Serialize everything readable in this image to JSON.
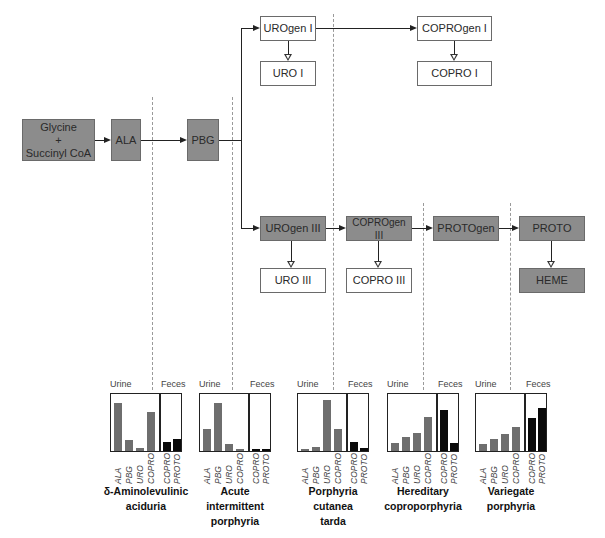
{
  "pathway": {
    "nodes": {
      "glycine": {
        "line1": "Glycine",
        "line2": "+",
        "line3": "Succinyl CoA"
      },
      "ala": "ALA",
      "pbg": "PBG",
      "urogen1": "UROgen I",
      "uro1": "URO I",
      "coprogen1": "COPROgen I",
      "copro1": "COPRO I",
      "urogen3": "UROgen III",
      "uro3": "URO III",
      "coprogen3": "COPROgen III",
      "copro3": "COPRO III",
      "protogen": "PROTOgen",
      "proto": "PROTO",
      "heme": "HEME"
    },
    "colors": {
      "dark_box": "#8c8c8c",
      "light_box": "#ffffff",
      "urine_bar": "#6e6e6e",
      "feces_bar": "#0a0a0a"
    }
  },
  "chart_data": [
    {
      "type": "bar",
      "title": "δ-Aminolevulinic aciduria",
      "groups": [
        "Urine",
        "Feces"
      ],
      "categories": [
        "ALA",
        "PBG",
        "URO",
        "COPRO",
        "COPRO",
        "PROTO"
      ],
      "series": [
        {
          "name": "Urine",
          "values": [
            88,
            20,
            5,
            70,
            null,
            null
          ]
        },
        {
          "name": "Feces",
          "values": [
            null,
            null,
            null,
            null,
            16,
            22
          ]
        }
      ],
      "ylim": [
        0,
        100
      ]
    },
    {
      "type": "bar",
      "title": "Acute intermittent porphyria",
      "groups": [
        "Urine",
        "Feces"
      ],
      "categories": [
        "ALA",
        "PBG",
        "URO",
        "COPRO",
        "COPRO",
        "PROTO"
      ],
      "series": [
        {
          "name": "Urine",
          "values": [
            40,
            88,
            12,
            4,
            null,
            null
          ]
        },
        {
          "name": "Feces",
          "values": [
            null,
            null,
            null,
            null,
            4,
            4
          ]
        }
      ],
      "ylim": [
        0,
        100
      ]
    },
    {
      "type": "bar",
      "title": "Porphyria cutanea tarda",
      "groups": [
        "Urine",
        "Feces"
      ],
      "categories": [
        "ALA",
        "PBG",
        "URO",
        "COPRO",
        "COPRO",
        "PROTO"
      ],
      "series": [
        {
          "name": "Urine",
          "values": [
            4,
            8,
            92,
            40,
            null,
            null
          ]
        },
        {
          "name": "Feces",
          "values": [
            null,
            null,
            null,
            null,
            16,
            5
          ]
        }
      ],
      "ylim": [
        0,
        100
      ]
    },
    {
      "type": "bar",
      "title": "Hereditary coproporphyria",
      "groups": [
        "Urine",
        "Feces"
      ],
      "categories": [
        "ALA",
        "PBG",
        "URO",
        "COPRO",
        "COPRO",
        "PROTO"
      ],
      "series": [
        {
          "name": "Urine",
          "values": [
            15,
            26,
            33,
            61,
            null,
            null
          ]
        },
        {
          "name": "Feces",
          "values": [
            null,
            null,
            null,
            null,
            74,
            15
          ]
        }
      ],
      "ylim": [
        0,
        100
      ]
    },
    {
      "type": "bar",
      "title": "Variegate porphyria",
      "groups": [
        "Urine",
        "Feces"
      ],
      "categories": [
        "ALA",
        "PBG",
        "URO",
        "COPRO",
        "COPRO",
        "PROTO"
      ],
      "series": [
        {
          "name": "Urine",
          "values": [
            12,
            21,
            31,
            43,
            null,
            null
          ]
        },
        {
          "name": "Feces",
          "values": [
            null,
            null,
            null,
            null,
            60,
            79
          ]
        }
      ],
      "ylim": [
        0,
        100
      ]
    }
  ],
  "charts": [
    {
      "urine": "Urine",
      "feces": "Feces",
      "x": [
        "ALA",
        "PBG",
        "URO",
        "COPRO",
        "COPRO",
        "PROTO"
      ],
      "caption": [
        "δ-Aminolevulinic",
        "aciduria"
      ]
    },
    {
      "urine": "Urine",
      "feces": "Feces",
      "x": [
        "ALA",
        "PBG",
        "URO",
        "COPRO",
        "COPRO",
        "PROTO"
      ],
      "caption": [
        "Acute",
        "intermittent",
        "porphyria"
      ]
    },
    {
      "urine": "Urine",
      "feces": "Feces",
      "x": [
        "ALA",
        "PBG",
        "URO",
        "COPRO",
        "COPRO",
        "PROTO"
      ],
      "caption": [
        "Porphyria",
        "cutanea",
        "tarda"
      ]
    },
    {
      "urine": "Urine",
      "feces": "Feces",
      "x": [
        "ALA",
        "PBG",
        "URO",
        "COPRO",
        "COPRO",
        "PROTO"
      ],
      "caption": [
        "Hereditary",
        "coproporphyria"
      ]
    },
    {
      "urine": "Urine",
      "feces": "Feces",
      "x": [
        "ALA",
        "PBG",
        "URO",
        "COPRO",
        "COPRO",
        "PROTO"
      ],
      "caption": [
        "Variegate",
        "porphyria"
      ]
    }
  ]
}
